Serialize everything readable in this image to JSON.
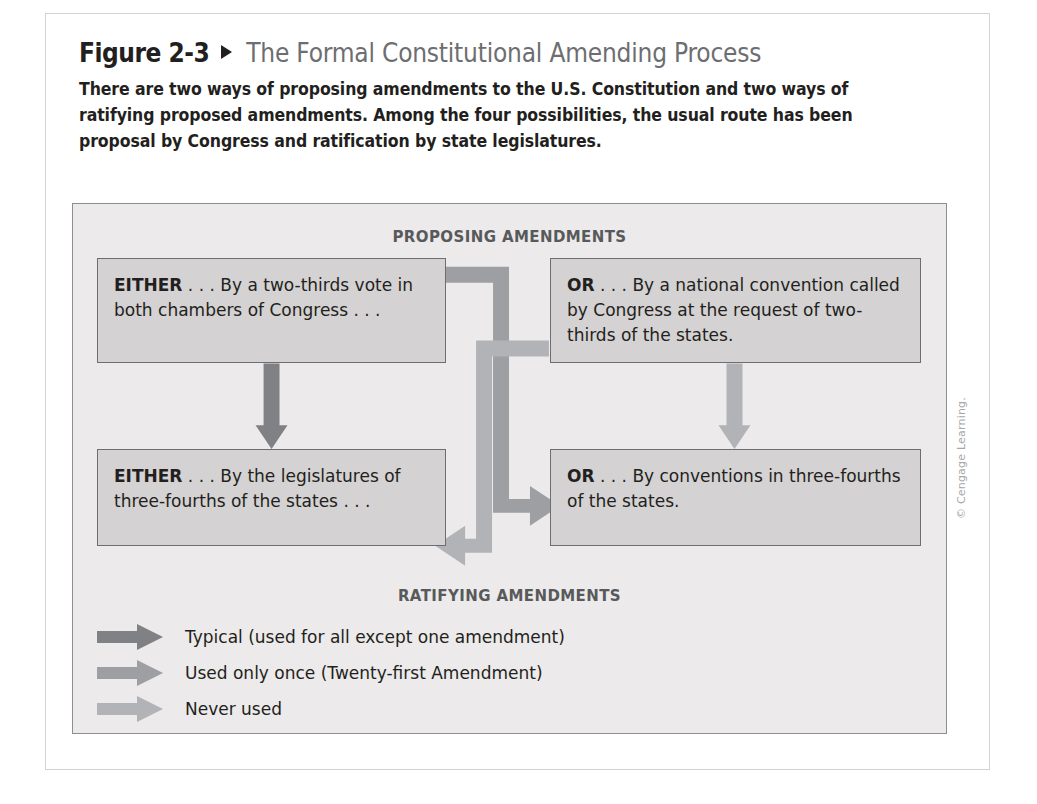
{
  "figure": {
    "label": "Figure 2-3",
    "marker_icon": "triangle-right-icon",
    "title": "The Formal Constitutional Amending Process",
    "caption": "There are two ways of proposing amendments to the U.S. Constitution and two ways of ratifying proposed amendments. Among the four possibilities, the usual route has been proposal by Congress and ratification by state legislatures."
  },
  "diagram": {
    "band_top": "PROPOSING AMENDMENTS",
    "band_bottom": "RATIFYING AMENDMENTS",
    "nodes": [
      {
        "id": "top-left",
        "lead": "EITHER",
        "ellipsis": " . . . ",
        "text": "By a two-thirds vote in both chambers of Congress . . ."
      },
      {
        "id": "top-right",
        "lead": "OR",
        "ellipsis": " . . . ",
        "text": "By a national convention called by Congress at the request of two-thirds of the states."
      },
      {
        "id": "bottom-left",
        "lead": "EITHER",
        "ellipsis": " . . . ",
        "text": "By the legislatures of three-fourths of the states . . ."
      },
      {
        "id": "bottom-right",
        "lead": "OR",
        "ellipsis": " . . . ",
        "text": "By conventions in three-fourths of the states."
      }
    ],
    "legend": [
      {
        "key": "typical",
        "label": "Typical (used for all except one amendment)",
        "color": "#808184"
      },
      {
        "key": "used-once",
        "label": "Used only once (Twenty-first Amendment)",
        "color": "#9d9fa2"
      },
      {
        "key": "never-used",
        "label": "Never used",
        "color": "#b1b3b6"
      }
    ],
    "colors": {
      "panel_bg": "#eceaea",
      "node_bg": "#d4d2d2",
      "node_border": "#6d6e71",
      "band_text": "#58595b",
      "arrow_typical": "#808184",
      "arrow_used_once": "#9d9fa2",
      "arrow_never_used": "#b1b3b6"
    }
  },
  "credit": "© Cengage Learning."
}
